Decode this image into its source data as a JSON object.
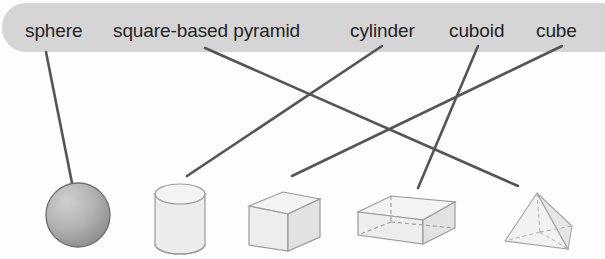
{
  "worksheet": {
    "title": "Match the 3D shape names to the shapes",
    "width": 605,
    "height": 259,
    "background_color": "#fdfdfd",
    "banner_color": "#d5d5d5",
    "line_color": "#555555",
    "label_color": "#232323"
  },
  "labels": [
    {
      "id": "sphere",
      "text": "sphere",
      "x": 25,
      "y": 21
    },
    {
      "id": "square-based-pyramid",
      "text": "square-based pyramid",
      "x": 113,
      "y": 21
    },
    {
      "id": "cylinder",
      "text": "cylinder",
      "x": 350,
      "y": 21
    },
    {
      "id": "cuboid",
      "text": "cuboid",
      "x": 449,
      "y": 21
    },
    {
      "id": "cube",
      "text": "cube",
      "x": 536,
      "y": 21
    }
  ],
  "shapes": [
    {
      "id": "sphere",
      "name": "sphere",
      "cx": 78,
      "cy": 215
    },
    {
      "id": "cylinder",
      "name": "cylinder",
      "cx": 180,
      "cy": 219
    },
    {
      "id": "cube",
      "name": "cube",
      "cx": 284,
      "cy": 221
    },
    {
      "id": "cuboid",
      "name": "cuboid",
      "cx": 406,
      "cy": 222
    },
    {
      "id": "pyramid",
      "name": "square-based pyramid",
      "cx": 537,
      "cy": 222
    }
  ],
  "connectors": [
    {
      "id": "sphere-line",
      "from_label": "sphere",
      "to_shape": "sphere",
      "x1": 46,
      "y1": 52,
      "x2": 72,
      "y2": 183
    },
    {
      "id": "pyramid-line",
      "from_label": "square-based pyramid",
      "to_shape": "pyramid",
      "x1": 205,
      "y1": 48,
      "x2": 518,
      "y2": 186
    },
    {
      "id": "cylinder-line",
      "from_label": "cylinder",
      "to_shape": "cylinder",
      "x1": 382,
      "y1": 46,
      "x2": 187,
      "y2": 176
    },
    {
      "id": "cuboid-line",
      "from_label": "cuboid",
      "to_shape": "cuboid",
      "x1": 478,
      "y1": 46,
      "x2": 418,
      "y2": 188
    },
    {
      "id": "cube-line",
      "from_label": "cube",
      "to_shape": "cube",
      "x1": 562,
      "y1": 46,
      "x2": 292,
      "y2": 176
    }
  ]
}
